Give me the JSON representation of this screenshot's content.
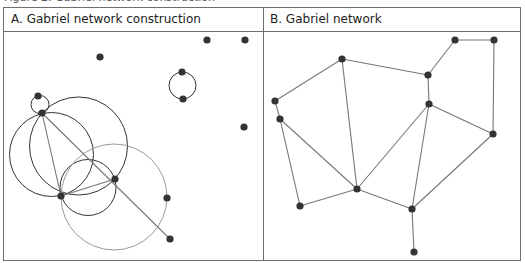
{
  "figure": {
    "caption": "Figure 2: Gabriel network construction",
    "panels": [
      {
        "label": "A. Gabriel network construction"
      },
      {
        "label": "B. Gabriel network"
      }
    ]
  },
  "colors": {
    "node": "#333333",
    "edge": "#777777",
    "circle_dark": "#333333",
    "circle_light": "#9a9a9a",
    "border": "#6e6e6e"
  },
  "panel_a": {
    "nodes": [
      {
        "id": "A",
        "x": 100,
        "y": 57
      },
      {
        "id": "B",
        "x": 207,
        "y": 40
      },
      {
        "id": "C",
        "x": 245,
        "y": 40
      },
      {
        "id": "D",
        "x": 182,
        "y": 72
      },
      {
        "id": "E",
        "x": 183,
        "y": 99
      },
      {
        "id": "F",
        "x": 38,
        "y": 96
      },
      {
        "id": "G",
        "x": 42,
        "y": 113
      },
      {
        "id": "H",
        "x": 244,
        "y": 127
      },
      {
        "id": "I",
        "x": 61,
        "y": 196
      },
      {
        "id": "J",
        "x": 115,
        "y": 179
      },
      {
        "id": "K",
        "x": 167,
        "y": 198
      },
      {
        "id": "L",
        "x": 170,
        "y": 239
      }
    ],
    "circles": [
      {
        "cx": 182.5,
        "cy": 85.5,
        "r": 13.5,
        "tone": "dark"
      },
      {
        "cx": 40,
        "cy": 104.5,
        "r": 9,
        "tone": "dark"
      },
      {
        "cx": 51.5,
        "cy": 154.5,
        "r": 42,
        "tone": "dark"
      },
      {
        "cx": 78.5,
        "cy": 146,
        "r": 49,
        "tone": "dark"
      },
      {
        "cx": 88,
        "cy": 187.5,
        "r": 28,
        "tone": "dark"
      },
      {
        "cx": 114,
        "cy": 197,
        "r": 53,
        "tone": "light"
      }
    ],
    "edges": [
      {
        "from": "G",
        "to": "I"
      },
      {
        "from": "G",
        "to": "L"
      },
      {
        "from": "I",
        "to": "J"
      }
    ]
  },
  "panel_b": {
    "nodes": [
      {
        "id": "1",
        "x": 342,
        "y": 59
      },
      {
        "id": "2",
        "x": 455,
        "y": 40
      },
      {
        "id": "3",
        "x": 494,
        "y": 40
      },
      {
        "id": "4",
        "x": 428,
        "y": 75
      },
      {
        "id": "5",
        "x": 275,
        "y": 101
      },
      {
        "id": "6",
        "x": 429,
        "y": 104
      },
      {
        "id": "7",
        "x": 280,
        "y": 119
      },
      {
        "id": "8",
        "x": 493,
        "y": 134
      },
      {
        "id": "9",
        "x": 357,
        "y": 189
      },
      {
        "id": "10",
        "x": 300,
        "y": 206
      },
      {
        "id": "11",
        "x": 412,
        "y": 209
      },
      {
        "id": "12",
        "x": 414,
        "y": 252
      }
    ],
    "edges": [
      {
        "from": "5",
        "to": "1"
      },
      {
        "from": "1",
        "to": "4"
      },
      {
        "from": "1",
        "to": "9"
      },
      {
        "from": "4",
        "to": "2"
      },
      {
        "from": "2",
        "to": "3"
      },
      {
        "from": "3",
        "to": "8"
      },
      {
        "from": "4",
        "to": "6"
      },
      {
        "from": "6",
        "to": "8"
      },
      {
        "from": "6",
        "to": "9"
      },
      {
        "from": "6",
        "to": "11"
      },
      {
        "from": "5",
        "to": "7"
      },
      {
        "from": "7",
        "to": "10"
      },
      {
        "from": "7",
        "to": "9"
      },
      {
        "from": "10",
        "to": "9"
      },
      {
        "from": "9",
        "to": "11"
      },
      {
        "from": "8",
        "to": "11"
      },
      {
        "from": "11",
        "to": "12"
      }
    ]
  }
}
